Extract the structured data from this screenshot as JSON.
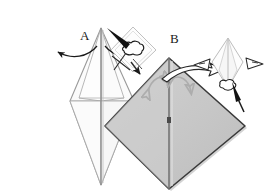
{
  "diagram": {
    "background_color": "#ffffff",
    "width": 270,
    "height": 196
  },
  "labels": {
    "step_a": "A",
    "step_b": "B"
  },
  "colors": {
    "paper_white": "#fdfdfd",
    "paper_gray": "#c9c9c9",
    "paper_gray_dark": "#b6b6b6",
    "outline_light": "#9a9a9a",
    "outline_dark": "#3a3a3a",
    "arrow_dark": "#1a1a1a",
    "arrow_gray": "#b0b0b0",
    "label_color": "#1a1a1a"
  },
  "figures": {
    "left": {
      "name": "narrow-kite-front-view",
      "fill": "#fdfdfd",
      "stroke": "#9a9a9a",
      "description": "tall narrow white kite with vertical center crease and horizontal fold lines"
    },
    "right": {
      "name": "gray-diamond-front-view",
      "fill": "#c9c9c9",
      "stroke": "#3a3a3a",
      "description": "large gray diamond with dark outline and vertical center crease"
    }
  },
  "annotations": {
    "left_arrows": [
      {
        "name": "fold-arrow-left",
        "direction": "left",
        "style": "thin-curved"
      },
      {
        "name": "fold-arrow-right",
        "direction": "right",
        "style": "thin-curved"
      }
    ],
    "right_arrows": [
      {
        "name": "rotate-arrow-left",
        "direction": "double",
        "style": "gray-curved"
      },
      {
        "name": "rotate-arrow-right",
        "direction": "double",
        "style": "gray-curved"
      },
      {
        "name": "sweep-arrow",
        "direction": "right",
        "style": "white-filled-curved"
      }
    ],
    "insets": [
      {
        "name": "inset-detail-left",
        "shape": "small-white-diamond",
        "marks": [
          "cloud-blob",
          "x-mark",
          "pointer-arrow"
        ]
      },
      {
        "name": "inset-detail-right",
        "shape": "small-white-kite",
        "marks": [
          "left-arrowhead",
          "right-arrowhead",
          "cloud-blob",
          "pointer-arrow"
        ]
      }
    ]
  }
}
